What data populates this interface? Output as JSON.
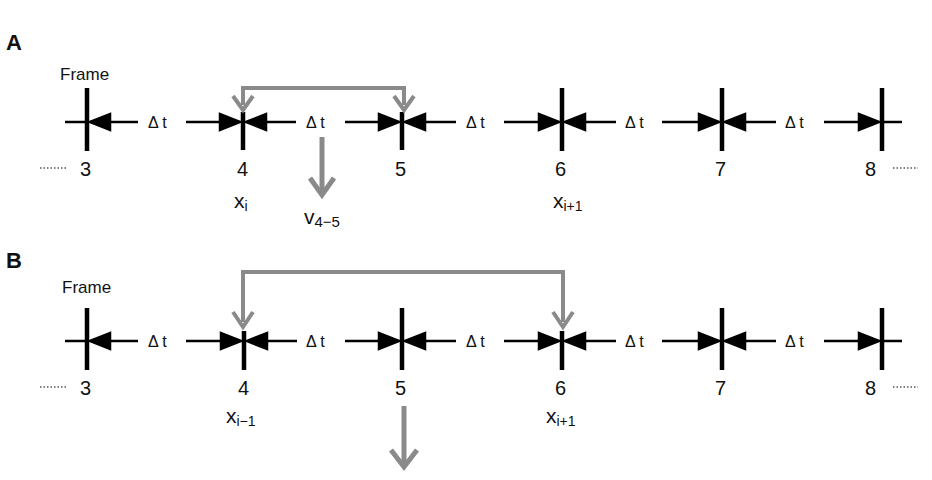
{
  "panels": [
    {
      "id": "A",
      "label": "A",
      "frame_label": "Frame",
      "delta_label": "Δ t",
      "frames": [
        "3",
        "4",
        "5",
        "6",
        "7",
        "8"
      ],
      "position_labels": [
        {
          "frame": "4",
          "base": "x",
          "sub": "i"
        },
        {
          "frame": "6",
          "base": "x",
          "sub": "i+1"
        }
      ],
      "bracket": {
        "from": "4",
        "to": "5"
      },
      "output_label": {
        "base": "v",
        "sub": "4−5"
      }
    },
    {
      "id": "B",
      "label": "B",
      "frame_label": "Frame",
      "delta_label": "Δ t",
      "frames": [
        "3",
        "4",
        "5",
        "6",
        "7",
        "8"
      ],
      "position_labels": [
        {
          "frame": "4",
          "base": "x",
          "sub": "i−1"
        },
        {
          "frame": "6",
          "base": "x",
          "sub": "i+1"
        }
      ],
      "bracket": {
        "from": "4",
        "to": "6"
      },
      "output_label": null
    }
  ],
  "colors": {
    "timeline": "#000000",
    "bracket": "#8a8a8a"
  }
}
